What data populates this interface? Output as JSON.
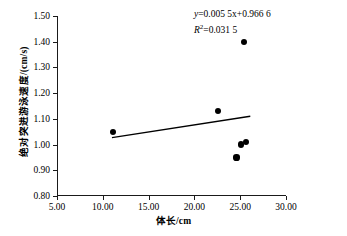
{
  "chart_data": {
    "type": "scatter",
    "title": "",
    "xlabel": "体长/cm",
    "ylabel": "绝对突进游泳速度/(cm/s)",
    "xlim": [
      5.0,
      30.0
    ],
    "ylim": [
      0.8,
      1.5
    ],
    "xticks": [
      "5.00",
      "10.00",
      "15.00",
      "20.00",
      "25.00",
      "30.00"
    ],
    "xtick_values": [
      5.0,
      10.0,
      15.0,
      20.0,
      25.0,
      30.0
    ],
    "yticks": [
      "0.80",
      "0.90",
      "1.00",
      "1.10",
      "1.20",
      "1.30",
      "1.40",
      "1.50"
    ],
    "ytick_values": [
      0.8,
      0.9,
      1.0,
      1.1,
      1.2,
      1.3,
      1.4,
      1.5
    ],
    "grid": false,
    "legend": null,
    "points": [
      {
        "x": 11.1,
        "y": 1.05
      },
      {
        "x": 22.6,
        "y": 1.13
      },
      {
        "x": 25.4,
        "y": 1.4
      },
      {
        "x": 24.6,
        "y": 0.95
      },
      {
        "x": 25.1,
        "y": 1.0
      },
      {
        "x": 25.6,
        "y": 1.01
      }
    ],
    "trendline": {
      "slope": 0.0055,
      "intercept": 0.9666,
      "x_start": 11.0,
      "x_end": 26.1
    },
    "annotation": {
      "equation_prefix": "y",
      "equation_body": "=0.005 5x+0.966 6",
      "r_squared_symbol": "R",
      "r_squared_exponent": "2",
      "r_squared_value": "=0.031 5"
    }
  }
}
